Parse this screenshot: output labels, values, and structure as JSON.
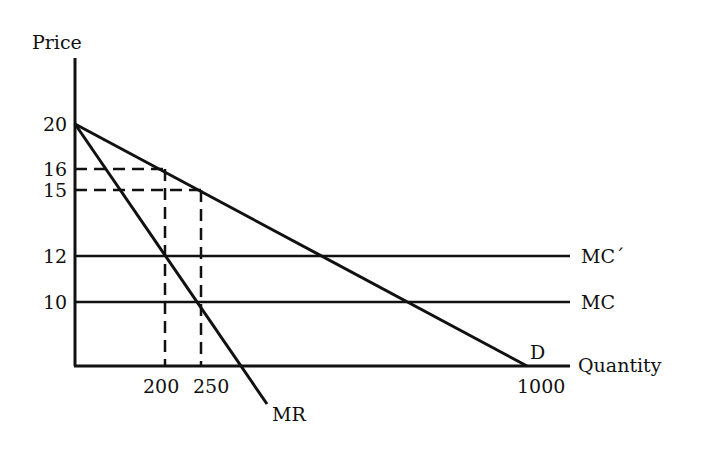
{
  "diagram": {
    "type": "monopoly-pricing",
    "y_axis_label": "Price",
    "x_axis_label": "Quantity",
    "y_ticks": [
      "20",
      "16",
      "15",
      "12",
      "10"
    ],
    "x_ticks": [
      "200",
      "250",
      "1000"
    ],
    "curves": {
      "demand": {
        "label": "D",
        "from": {
          "q": 0,
          "p": 20
        },
        "to": {
          "q": 1000,
          "p": 0
        }
      },
      "marginal_revenue": {
        "label": "MR",
        "from": {
          "q": 0,
          "p": 20
        },
        "to": {
          "q": 500,
          "p": 0
        }
      },
      "mc": {
        "label": "MC",
        "price": 10
      },
      "mc_prime": {
        "label": "MC´",
        "price": 12
      }
    },
    "guides": [
      {
        "q": 200,
        "p": 16
      },
      {
        "q": 250,
        "p": 15
      }
    ],
    "colors": {
      "ink": "#111111",
      "background": "#ffffff"
    }
  }
}
